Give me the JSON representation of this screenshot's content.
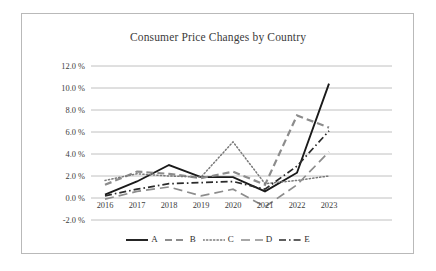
{
  "figure": {
    "background_color": "#ffffff",
    "frame_color": "#b9b9b9",
    "grid_color": "#b0b0b0"
  },
  "chart_data": {
    "type": "line",
    "title": "Consumer Price Changes by Country",
    "xlabel": "",
    "ylabel": "",
    "categories": [
      "2016",
      "2017",
      "2018",
      "2019",
      "2020",
      "2021",
      "2022",
      "2023"
    ],
    "x_tick_labels": [
      "2016",
      "2017",
      "2018",
      "2019",
      "2020",
      "2021",
      "2022",
      "2023"
    ],
    "y_tick_labels": [
      "12.0 %",
      "10.0 %",
      "8.0 %",
      "6.0 %",
      "4.0 %",
      "2.0 %",
      "0.0 %",
      "-2.0 %"
    ],
    "y_tick_values": [
      12.0,
      10.0,
      8.0,
      6.0,
      4.0,
      2.0,
      0.0,
      -2.0
    ],
    "ylim": [
      -2.0,
      12.0
    ],
    "grid": "horizontal",
    "legend_position": "bottom",
    "series": [
      {
        "name": "A",
        "style": "solid",
        "color": "#1a1a1a",
        "width": 1.9,
        "values": [
          0.3,
          1.5,
          3.0,
          1.9,
          1.9,
          0.6,
          2.3,
          10.4
        ]
      },
      {
        "name": "B",
        "style": "dashed",
        "color": "#8c8c8c",
        "width": 2.2,
        "values": [
          1.2,
          2.4,
          2.2,
          1.8,
          2.4,
          1.2,
          7.5,
          6.4
        ]
      },
      {
        "name": "C",
        "style": "dotted",
        "color": "#7a7a7a",
        "width": 1.5,
        "values": [
          1.6,
          2.2,
          2.0,
          1.9,
          5.1,
          1.3,
          1.6,
          2.0
        ]
      },
      {
        "name": "D",
        "style": "long-dash",
        "color": "#8c8c8c",
        "width": 1.7,
        "values": [
          -0.1,
          0.6,
          1.0,
          0.2,
          0.8,
          -0.8,
          1.2,
          4.2
        ]
      },
      {
        "name": "E",
        "style": "dash-dot",
        "color": "#2b2b2b",
        "width": 1.7,
        "values": [
          0.2,
          0.8,
          1.3,
          1.4,
          1.5,
          0.8,
          2.9,
          6.1
        ]
      }
    ],
    "legend_entries": [
      {
        "label": "A",
        "style": "solid"
      },
      {
        "label": "B",
        "style": "dashed"
      },
      {
        "label": "C",
        "style": "dotted"
      },
      {
        "label": "D",
        "style": "long-dash"
      },
      {
        "label": "E",
        "style": "dash-dot"
      }
    ]
  }
}
